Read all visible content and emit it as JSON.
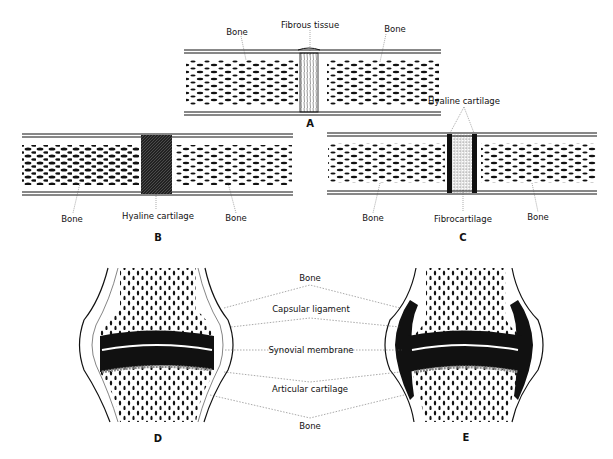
{
  "figure": {
    "panels": [
      {
        "id": "A",
        "label": "A",
        "type": "fibrous-joint",
        "labels": {
          "left_bone": "Bone",
          "joint_tissue": "Fibrous tissue",
          "right_bone": "Bone"
        }
      },
      {
        "id": "B",
        "label": "B",
        "type": "cartilaginous-joint-hyaline",
        "labels": {
          "left_bone": "Bone",
          "joint_tissue": "Hyaline cartilage",
          "right_bone": "Bone"
        }
      },
      {
        "id": "C",
        "label": "C",
        "type": "cartilaginous-joint-fibrocartilage",
        "labels": {
          "left_bone": "Bone",
          "joint_tissue": "Fibrocartilage",
          "right_bone": "Bone",
          "top_tissue": "Hyaline cartilage"
        }
      },
      {
        "id": "D",
        "label": "D",
        "type": "synovial-joint"
      },
      {
        "id": "E",
        "label": "E",
        "type": "synovial-joint-expanded"
      }
    ],
    "shared_labels": {
      "bone_top": "Bone",
      "capsular_ligament": "Capsular ligament",
      "synovial_membrane": "Synovial membrane",
      "articular_cartilage": "Articular cartilage",
      "bone_bottom": "Bone"
    }
  }
}
